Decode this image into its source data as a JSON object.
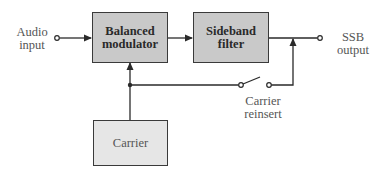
{
  "diagram": {
    "type": "block-diagram",
    "inputs": [
      {
        "id": "audio_input",
        "label_line1": "Audio",
        "label_line2": "input"
      }
    ],
    "outputs": [
      {
        "id": "ssb_output",
        "label_line1": "SSB",
        "label_line2": "output"
      }
    ],
    "blocks": [
      {
        "id": "balanced_modulator",
        "label_line1": "Balanced",
        "label_line2": "modulator",
        "fill": "#c9c9c9"
      },
      {
        "id": "sideband_filter",
        "label_line1": "Sideband",
        "label_line2": "filter",
        "fill": "#c9c9c9"
      },
      {
        "id": "carrier",
        "label": "Carrier",
        "fill": "#e6e6e6"
      }
    ],
    "switches": [
      {
        "id": "carrier_reinsert",
        "label_line1": "Carrier",
        "label_line2": "reinsert",
        "state": "open"
      }
    ],
    "connections": [
      {
        "from": "audio_input",
        "to": "balanced_modulator"
      },
      {
        "from": "balanced_modulator",
        "to": "sideband_filter"
      },
      {
        "from": "sideband_filter",
        "to": "ssb_output"
      },
      {
        "from": "carrier",
        "to": "balanced_modulator"
      },
      {
        "from": "carrier",
        "to": "carrier_reinsert"
      },
      {
        "from": "carrier_reinsert",
        "to": "ssb_output"
      }
    ]
  }
}
